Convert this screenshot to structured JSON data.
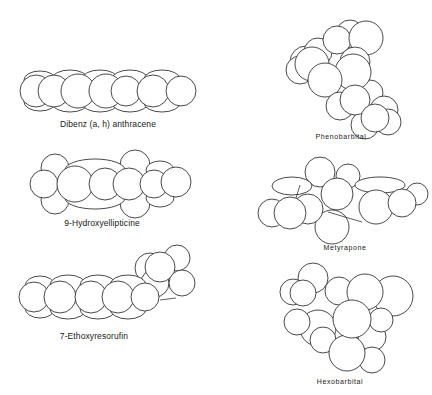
{
  "figure": {
    "type": "space-filling molecular models",
    "molecules": [
      {
        "id": "dibenz",
        "name": "Dibenz (a, h) anthracene",
        "shape": "planar-linear"
      },
      {
        "id": "hydroxyellipticine",
        "name": "9-Hydroxyellipticine",
        "shape": "planar-linear"
      },
      {
        "id": "ethoxyresorufin",
        "name": "7-Ethoxyresorufin",
        "shape": "planar-with-side-chain"
      },
      {
        "id": "phenobarbital",
        "name": "Phenobarbital",
        "shape": "globular"
      },
      {
        "id": "metyrapone",
        "name": "Metyrapone",
        "shape": "bent"
      },
      {
        "id": "hexobarbital",
        "name": "Hexobarbital",
        "shape": "globular"
      }
    ]
  },
  "colors": {
    "stroke": "#1a1a1a",
    "fill": "#ffffff",
    "background": "#ffffff"
  }
}
